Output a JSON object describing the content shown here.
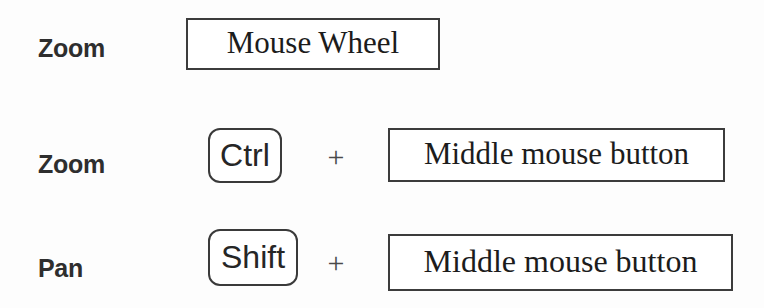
{
  "sheet": {
    "title": "Mouse and keyboard navigation shortcuts",
    "background_color": "#fdfdfd",
    "text_color": "#1c1c1c",
    "border_color": "#3c3c3c"
  },
  "rows": [
    {
      "id": "row-zoom-wheel",
      "action": "Zoom",
      "modifier": null,
      "separator": null,
      "input": "Mouse Wheel"
    },
    {
      "id": "row-zoom-ctrl",
      "action": "Zoom",
      "modifier": "Ctrl",
      "separator": "+",
      "input": "Middle mouse button"
    },
    {
      "id": "row-pan-shift",
      "action": "Pan",
      "modifier": "Shift",
      "separator": "+",
      "input": "Middle mouse button"
    }
  ]
}
